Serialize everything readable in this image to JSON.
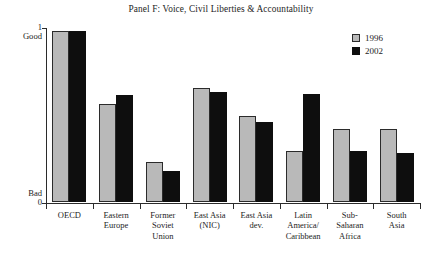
{
  "chart_data": {
    "type": "bar",
    "title": "Panel F: Voice, Civil Liberties & Accountability",
    "xlabel": "",
    "ylabel": "",
    "ylim": [
      0,
      1
    ],
    "grid": false,
    "legend_position": "top-right",
    "y_axis": {
      "ticks": [
        {
          "value": 1,
          "num": "1",
          "word": "Good"
        },
        {
          "value": 0,
          "num": "0",
          "word": "Bad"
        }
      ]
    },
    "categories": [
      "OECD",
      "Eastern Europe",
      "Former Soviet Union",
      "East Asia (NIC)",
      "East Asia dev.",
      "Latin America/Caribbean",
      "Sub-Saharan Africa",
      "South Asia"
    ],
    "category_label_lines": [
      [
        "OECD"
      ],
      [
        "Eastern",
        "Europe"
      ],
      [
        "Former",
        "Soviet",
        "Union"
      ],
      [
        "East Asia",
        "(NIC)"
      ],
      [
        "East Asia",
        "dev."
      ],
      [
        "Latin",
        "America/",
        "Caribbean"
      ],
      [
        "Sub-",
        "Saharan",
        "Africa"
      ],
      [
        "South",
        "Asia"
      ]
    ],
    "series": [
      {
        "name": "1996",
        "color": "#b9b9b9",
        "values": [
          0.98,
          0.56,
          0.23,
          0.65,
          0.49,
          0.29,
          0.42,
          0.42
        ]
      },
      {
        "name": "2002",
        "color": "#0e0e0e",
        "values": [
          0.98,
          0.61,
          0.18,
          0.63,
          0.46,
          0.62,
          0.29,
          0.28
        ]
      }
    ]
  },
  "legend": {
    "items": [
      {
        "label": "1996",
        "swatch": "light-gray-square"
      },
      {
        "label": "2002",
        "swatch": "black-square"
      }
    ]
  }
}
